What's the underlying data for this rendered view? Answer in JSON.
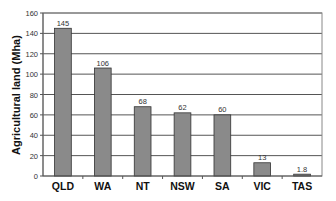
{
  "chart_data": {
    "type": "bar",
    "title": "",
    "xlabel": "",
    "ylabel": "Agricultural land (Mha)",
    "categories": [
      "QLD",
      "WA",
      "NT",
      "NSW",
      "SA",
      "VIC",
      "TAS"
    ],
    "values": [
      145,
      106,
      68,
      62,
      60,
      13,
      1.8
    ],
    "data_labels": [
      "145",
      "106",
      "68",
      "62",
      "60",
      "13",
      "1.8"
    ],
    "ylim": [
      0,
      160
    ],
    "yticks": [
      0,
      20,
      40,
      60,
      80,
      100,
      120,
      140,
      160
    ],
    "grid": true,
    "legend": null,
    "bar_color": "#8a8a8a"
  }
}
